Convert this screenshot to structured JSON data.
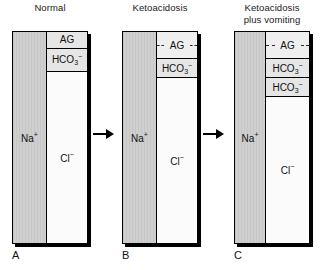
{
  "figure": {
    "caption_letters": [
      "A",
      "B",
      "C"
    ]
  },
  "panels": [
    {
      "id": "a",
      "letter": "A",
      "title_lines": [
        "Normal"
      ],
      "cation": {
        "label_html": "Na",
        "charge": "+",
        "name": "sodium"
      },
      "segments": [
        {
          "type": "ag",
          "label": "AG",
          "dashed": false,
          "height_pct": 8
        },
        {
          "type": "hco3",
          "label": "HCO",
          "sub": "3",
          "charge": "−",
          "height_pct": 11
        },
        {
          "type": "cl",
          "label": "Cl",
          "charge": "−"
        }
      ]
    },
    {
      "id": "b",
      "letter": "B",
      "title_lines": [
        "Ketoacidosis"
      ],
      "cation": {
        "label_html": "Na",
        "charge": "+",
        "name": "sodium"
      },
      "segments": [
        {
          "type": "ag",
          "label": "AG",
          "dashed": true,
          "height_pct": 13
        },
        {
          "type": "hco3",
          "label": "HCO",
          "sub": "3",
          "charge": "−",
          "height_pct": 9
        },
        {
          "type": "cl",
          "label": "Cl",
          "charge": "−"
        }
      ]
    },
    {
      "id": "c",
      "letter": "C",
      "title_lines": [
        "Ketoacidosis",
        "plus vomiting"
      ],
      "cation": {
        "label_html": "Na",
        "charge": "+",
        "name": "sodium"
      },
      "segments": [
        {
          "type": "ag",
          "label": "AG",
          "dashed": true,
          "height_pct": 13
        },
        {
          "type": "hco3",
          "label": "HCO",
          "sub": "3",
          "charge": "−",
          "height_pct": 9
        },
        {
          "type": "hco3",
          "label": "HCO",
          "sub": "3",
          "charge": "−",
          "height_pct": 9
        },
        {
          "type": "cl",
          "label": "Cl",
          "charge": "−"
        }
      ]
    }
  ],
  "arrows": [
    {
      "name": "arrow-a-to-b",
      "direction": "right"
    },
    {
      "name": "arrow-b-to-c",
      "direction": "right"
    }
  ],
  "colors": {
    "cation_fill": "#cfcfcf",
    "segment_fill": "#e6e6e6",
    "chloride_fill": "#fbfbfb",
    "border": "#000000",
    "text": "#111111"
  }
}
